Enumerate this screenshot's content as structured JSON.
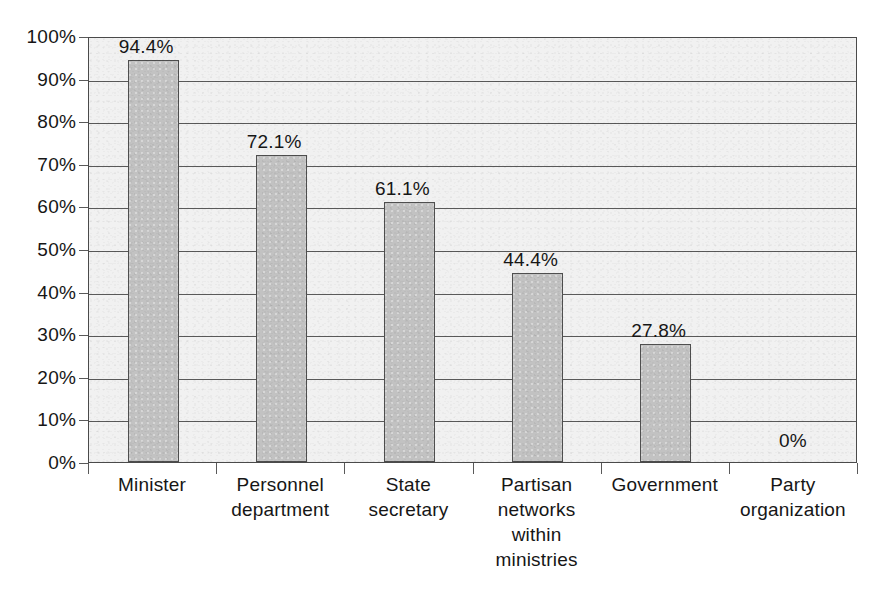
{
  "chart_data": {
    "type": "bar",
    "title": "",
    "subtitle": "",
    "xlabel": "",
    "ylabel": "",
    "categories": [
      "Minister",
      "Personnel department",
      "State secretary",
      "Partisan networks within ministries",
      "Government",
      "Party organization"
    ],
    "category_lines": [
      [
        "Minister"
      ],
      [
        "Personnel",
        "department"
      ],
      [
        "State",
        "secretary"
      ],
      [
        "Partisan",
        "networks",
        "within",
        "ministries"
      ],
      [
        "Government"
      ],
      [
        "Party",
        "organization"
      ]
    ],
    "values": [
      94.4,
      72.1,
      61.1,
      44.4,
      27.8,
      0
    ],
    "data_labels": [
      "94.4%",
      "72.1%",
      "61.1%",
      "44.4%",
      "27.8%",
      "0%"
    ],
    "ylim": [
      0,
      100
    ],
    "ytick_values": [
      0,
      10,
      20,
      30,
      40,
      50,
      60,
      70,
      80,
      90,
      100
    ],
    "ytick_labels": [
      "0%",
      "10%",
      "20%",
      "30%",
      "40%",
      "50%",
      "60%",
      "70%",
      "80%",
      "90%",
      "100%"
    ],
    "grid": true,
    "grid_axis": "y",
    "legend": false,
    "legend_position": "none",
    "colors": {
      "bar_fill": "#c2c2c2",
      "bar_border": "#4f4f4f",
      "plot_background": "#f1f1f1",
      "grid_line": "#595959",
      "axis_line": "#4a4a4a",
      "text": "#161616",
      "page_background": "#ffffff"
    }
  }
}
